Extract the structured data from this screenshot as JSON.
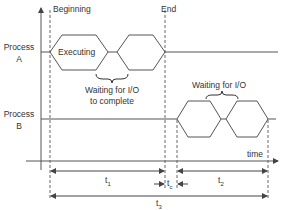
{
  "labels": {
    "beginning": "Beginning",
    "end": "End",
    "process_a_line1": "Process",
    "process_a_line2": "A",
    "process_b_line1": "Process",
    "process_b_line2": "B",
    "executing": "Executing",
    "waiting_a_line1": "Waiting for I/O",
    "waiting_a_line2": "to complete",
    "waiting_b": "Waiting for I/O",
    "time_axis": "time",
    "t1": "t",
    "t1_sub": "1",
    "tc": "t",
    "tc_sub": "c",
    "t2": "t",
    "t2_sub": "2",
    "t3": "t",
    "t3_sub": "3"
  },
  "colors": {
    "line": "#555555",
    "text": "#333333"
  }
}
